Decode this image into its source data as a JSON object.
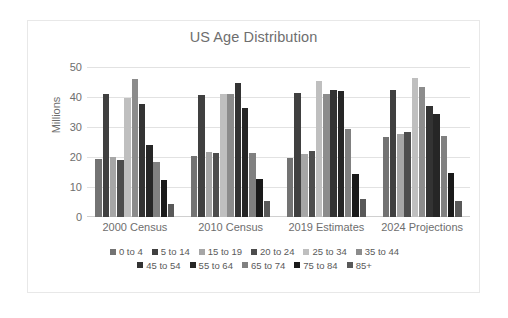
{
  "chart_data": {
    "type": "bar",
    "title": "US Age Distribution",
    "xlabel": "",
    "ylabel": "Millions",
    "ylim": [
      0,
      50
    ],
    "yticks": [
      0,
      10,
      20,
      30,
      40,
      50
    ],
    "grid": true,
    "legend_position": "bottom",
    "categories": [
      "2000 Census",
      "2010 Census",
      "2019 Estimates",
      "2024 Projections"
    ],
    "series": [
      {
        "name": "0 to 4",
        "color": "#737373",
        "values": [
          19.2,
          20.2,
          19.8,
          26.8
        ]
      },
      {
        "name": "5 to 14",
        "color": "#404040",
        "values": [
          41.1,
          40.8,
          41.2,
          42.2
        ]
      },
      {
        "name": "15 to 19",
        "color": "#a6a6a6",
        "values": [
          20.0,
          21.8,
          20.9,
          27.6
        ]
      },
      {
        "name": "20 to 24",
        "color": "#4d4d4d",
        "values": [
          19.1,
          21.4,
          21.9,
          28.4
        ]
      },
      {
        "name": "25 to 34",
        "color": "#bfbfbf",
        "values": [
          39.6,
          40.9,
          45.3,
          46.2
        ]
      },
      {
        "name": "35 to 44",
        "color": "#8c8c8c",
        "values": [
          45.9,
          40.9,
          40.9,
          43.3
        ]
      },
      {
        "name": "45 to 54",
        "color": "#333333",
        "values": [
          37.6,
          44.8,
          42.4,
          36.9
        ]
      },
      {
        "name": "55 to 64",
        "color": "#262626",
        "values": [
          24.1,
          36.3,
          41.9,
          34.5
        ]
      },
      {
        "name": "65 to 74",
        "color": "#808080",
        "values": [
          18.4,
          21.5,
          29.4,
          26.9
        ]
      },
      {
        "name": "75 to 84",
        "color": "#1a1a1a",
        "values": [
          12.3,
          12.8,
          14.3,
          14.7
        ]
      },
      {
        "name": "85+",
        "color": "#595959",
        "values": [
          4.2,
          5.3,
          6.0,
          5.2
        ]
      }
    ]
  },
  "chart": {
    "title": "US Age Distribution",
    "y_axis_title": "Millions",
    "y_tick_labels": [
      "50",
      "40",
      "30",
      "20",
      "10",
      "0"
    ],
    "x_labels": [
      "2000 Census",
      "2010 Census",
      "2019 Estimates",
      "2024 Projections"
    ],
    "legend_row_1": [
      "0 to 4",
      "5 to 14",
      "15 to 19",
      "20 to 24",
      "25 to 34",
      "35 to 44"
    ],
    "legend_row_2": [
      "45 to 54",
      "55 to 64",
      "65 to 74",
      "75 to 84",
      "85+"
    ]
  }
}
